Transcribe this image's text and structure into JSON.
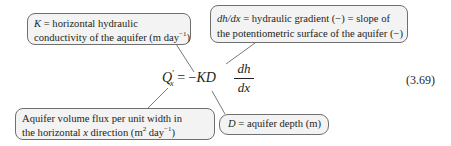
{
  "callouts": {
    "k": {
      "symbol": "K",
      "line1_rest": " = horizontal hydraulic",
      "line2_pre": "conductivity of the aquifer (m day",
      "line2_sup": "−1",
      "line2_post": ")"
    },
    "gradient": {
      "symbol": "dh/dx",
      "line1_rest": " = hydraulic gradient (−) = slope of",
      "line2": "the potentiometric surface of the aquifer (−)"
    },
    "flux": {
      "line1": "Aquifer volume flux per unit width in",
      "line2_pre": "the horizontal ",
      "line2_var": "x",
      "line2_mid": " direction (m",
      "line2_sup1": "2",
      "line2_mid2": " day",
      "line2_sup2": "−1",
      "line2_post": ")"
    },
    "depth": {
      "symbol": "D",
      "rest": " = aquifer depth (m)"
    }
  },
  "equation": {
    "lhs_var": "Q",
    "lhs_prime": "′",
    "lhs_sub": "x",
    "equals": " = −",
    "kd": "KD",
    "numerator": "dh",
    "denominator": "dx",
    "number": "(3.69)"
  }
}
